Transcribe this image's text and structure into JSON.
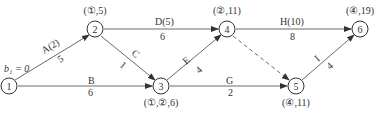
{
  "diagram": {
    "type": "activity-on-arrow network (double-code network diagram)",
    "start_annotation": "b₁ = 0",
    "nodes": [
      {
        "id": "1",
        "label": "1",
        "annotation": ""
      },
      {
        "id": "2",
        "label": "2",
        "annotation": "(①,5)"
      },
      {
        "id": "3",
        "label": "3",
        "annotation": "(①,②,6)"
      },
      {
        "id": "4",
        "label": "4",
        "annotation": "(②,11)"
      },
      {
        "id": "5",
        "label": "5",
        "annotation": "(④,11)"
      },
      {
        "id": "6",
        "label": "6",
        "annotation": "(④,19)"
      }
    ],
    "edges": [
      {
        "from": "1",
        "to": "2",
        "name": "A(2)",
        "duration": "5",
        "style": "solid"
      },
      {
        "from": "1",
        "to": "3",
        "name": "B",
        "duration": "6",
        "style": "solid"
      },
      {
        "from": "2",
        "to": "3",
        "name": "C",
        "duration": "1",
        "style": "solid"
      },
      {
        "from": "2",
        "to": "4",
        "name": "D(5)",
        "duration": "6",
        "style": "solid"
      },
      {
        "from": "3",
        "to": "4",
        "name": "E",
        "duration": "4",
        "style": "solid"
      },
      {
        "from": "3",
        "to": "5",
        "name": "G",
        "duration": "2",
        "style": "solid"
      },
      {
        "from": "4",
        "to": "6",
        "name": "H(10)",
        "duration": "8",
        "style": "solid"
      },
      {
        "from": "4",
        "to": "5",
        "name": "",
        "duration": "",
        "style": "dashed"
      },
      {
        "from": "5",
        "to": "6",
        "name": "I",
        "duration": "4",
        "style": "solid"
      }
    ]
  }
}
